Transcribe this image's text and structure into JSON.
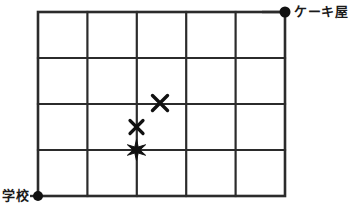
{
  "diagram": {
    "title": "",
    "type": "grid-map",
    "colors": {
      "line": "#2b2b2b",
      "marker": "#111111",
      "background": "#ffffff",
      "text": "#1a1a1a"
    },
    "grid": {
      "columns": 5,
      "rows": 4,
      "left": 38,
      "top": 12,
      "right": 285,
      "bottom": 196,
      "cell_width": 49.4,
      "cell_height": 46,
      "x_lines": [
        38,
        87.4,
        136.8,
        186.2,
        235.6,
        285
      ],
      "y_lines": [
        12,
        58,
        104,
        150,
        196
      ],
      "outer_stroke": 2.6,
      "inner_stroke": 2.2
    },
    "endpoints": [
      {
        "id": "school",
        "label": "学校",
        "marker": "dot",
        "x": 38,
        "y": 196,
        "radius": 5,
        "label_x": 2,
        "label_y": 189,
        "label_position": "left"
      },
      {
        "id": "cake-shop",
        "label": "ケーキ屋",
        "marker": "dot",
        "x": 285,
        "y": 12,
        "radius": 5.5,
        "label_x": 294,
        "label_y": 5,
        "label_position": "right"
      }
    ],
    "markers": [
      {
        "id": "cross-upper",
        "shape": "x",
        "x": 160,
        "y": 103,
        "size": 7.5,
        "stroke": 3.4
      },
      {
        "id": "cross-lower",
        "shape": "x",
        "x": 136.5,
        "y": 127,
        "size": 6.5,
        "stroke": 3.2
      },
      {
        "id": "star-point",
        "shape": "star6",
        "x": 136.5,
        "y": 150,
        "size": 10.5
      }
    ],
    "connectors": [
      {
        "id": "cakeshop-stub",
        "from_x": 262,
        "from_y": 12,
        "to_x": 285,
        "to_y": 12,
        "stroke": 2.4
      },
      {
        "id": "school-stub",
        "from_x": 30,
        "from_y": 196,
        "to_x": 38,
        "to_y": 196,
        "stroke": 2.4
      }
    ]
  }
}
